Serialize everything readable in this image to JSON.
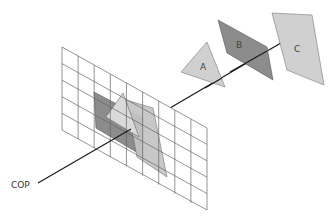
{
  "diagram": {
    "type": "perspective-projection",
    "labels": {
      "cop": "COP",
      "object_a": "A",
      "object_b": "B",
      "object_c": "C"
    },
    "colors": {
      "light_fill": "#d0d0d0",
      "dark_fill": "#8c8c8c",
      "stroke": "#555555",
      "grid_line": "#666666",
      "axis_line": "#1a1a1a"
    },
    "grid": {
      "columns": 9,
      "rows": 5
    },
    "objects": [
      {
        "id": "A",
        "shape": "triangle",
        "fill": "light"
      },
      {
        "id": "B",
        "shape": "parallelogram",
        "fill": "dark"
      },
      {
        "id": "C",
        "shape": "parallelogram",
        "fill": "light"
      }
    ]
  }
}
